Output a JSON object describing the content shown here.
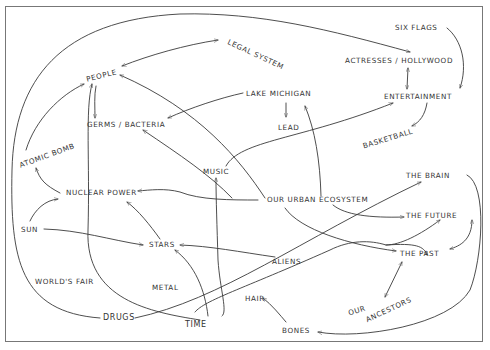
{
  "diagram": {
    "style": "hand-drawn concept map",
    "line_color": "#3a3a3a",
    "nodes": [
      {
        "id": "legal_system",
        "label": "Legal System"
      },
      {
        "id": "six_flags",
        "label": "Six Flags"
      },
      {
        "id": "actresses_hollywood",
        "label": "Actresses / Hollywood"
      },
      {
        "id": "people",
        "label": "People"
      },
      {
        "id": "lake_michigan",
        "label": "Lake Michigan"
      },
      {
        "id": "entertainment",
        "label": "Entertainment"
      },
      {
        "id": "germs_bacteria",
        "label": "Germs / Bacteria"
      },
      {
        "id": "lead",
        "label": "Lead"
      },
      {
        "id": "basketball",
        "label": "Basketball"
      },
      {
        "id": "atomic_bomb",
        "label": "Atomic Bomb"
      },
      {
        "id": "music",
        "label": "Music"
      },
      {
        "id": "the_brain",
        "label": "The Brain"
      },
      {
        "id": "nuclear_power",
        "label": "Nuclear Power"
      },
      {
        "id": "our_urban_ecosystem",
        "label": "Our Urban Ecosystem"
      },
      {
        "id": "sun",
        "label": "Sun"
      },
      {
        "id": "the_future",
        "label": "The Future"
      },
      {
        "id": "stars",
        "label": "Stars"
      },
      {
        "id": "aliens",
        "label": "Aliens"
      },
      {
        "id": "the_past",
        "label": "The Past"
      },
      {
        "id": "worlds_fair",
        "label": "World's Fair"
      },
      {
        "id": "metal",
        "label": "Metal"
      },
      {
        "id": "our",
        "label": "Our"
      },
      {
        "id": "ancestors",
        "label": "Ancestors"
      },
      {
        "id": "hair",
        "label": "Hair"
      },
      {
        "id": "drugs",
        "label": "Drugs"
      },
      {
        "id": "time",
        "label": "Time"
      },
      {
        "id": "bones",
        "label": "Bones"
      }
    ],
    "edges": [
      {
        "from": "people",
        "to": "legal_system",
        "direction": "both"
      },
      {
        "from": "drugs",
        "to": "actresses_hollywood",
        "direction": "forward"
      },
      {
        "from": "actresses_hollywood",
        "to": "entertainment",
        "direction": "both"
      },
      {
        "from": "six_flags",
        "to": "entertainment",
        "direction": "forward"
      },
      {
        "from": "entertainment",
        "to": "basketball",
        "direction": "forward"
      },
      {
        "from": "lake_michigan",
        "to": "lead",
        "direction": "forward"
      },
      {
        "from": "lake_michigan",
        "to": "germs_bacteria",
        "direction": "forward"
      },
      {
        "from": "people",
        "to": "germs_bacteria",
        "direction": "forward"
      },
      {
        "from": "atomic_bomb",
        "to": "people",
        "direction": "forward"
      },
      {
        "from": "time",
        "to": "people",
        "direction": "forward"
      },
      {
        "from": "our_urban_ecosystem",
        "to": "people",
        "direction": "forward"
      },
      {
        "from": "our_urban_ecosystem",
        "to": "germs_bacteria",
        "direction": "forward"
      },
      {
        "from": "our_urban_ecosystem",
        "to": "lake_michigan",
        "direction": "forward"
      },
      {
        "from": "music",
        "to": "entertainment",
        "direction": "forward"
      },
      {
        "from": "time",
        "to": "music",
        "direction": "forward"
      },
      {
        "from": "nuclear_power",
        "to": "atomic_bomb",
        "direction": "forward"
      },
      {
        "from": "sun",
        "to": "nuclear_power",
        "direction": "forward"
      },
      {
        "from": "sun",
        "to": "stars",
        "direction": "forward"
      },
      {
        "from": "stars",
        "to": "nuclear_power",
        "direction": "forward"
      },
      {
        "from": "our_urban_ecosystem",
        "to": "nuclear_power",
        "direction": "forward"
      },
      {
        "from": "our_urban_ecosystem",
        "to": "the_future",
        "direction": "forward"
      },
      {
        "from": "our_urban_ecosystem",
        "to": "the_past",
        "direction": "forward"
      },
      {
        "from": "aliens",
        "to": "stars",
        "direction": "forward"
      },
      {
        "from": "time",
        "to": "stars",
        "direction": "forward"
      },
      {
        "from": "drugs",
        "to": "the_brain",
        "direction": "forward"
      },
      {
        "from": "time",
        "to": "the_future",
        "direction": "forward"
      },
      {
        "from": "time",
        "to": "the_past",
        "direction": "forward"
      },
      {
        "from": "the_future",
        "to": "the_past",
        "direction": "both"
      },
      {
        "from": "the_past",
        "to": "ancestors",
        "direction": "both"
      },
      {
        "from": "the_brain",
        "to": "bones",
        "direction": "forward"
      },
      {
        "from": "bones",
        "to": "hair",
        "direction": "forward"
      }
    ]
  }
}
